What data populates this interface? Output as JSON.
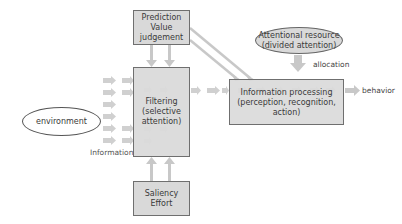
{
  "diagram": {
    "nodes": {
      "prediction": {
        "line1": "Prediction",
        "line2": "Value",
        "line3": "judgement"
      },
      "filtering": {
        "line1": "Filtering",
        "line2": "(selective",
        "line3": "attention)"
      },
      "saliency": {
        "line1": "Saliency",
        "line2": "Effort"
      },
      "processing": {
        "line1": "Information processing",
        "line2": "(perception, recognition, action)"
      },
      "attentional": {
        "line1": "Attentional resource",
        "line2": "(divided attention)"
      },
      "environment": {
        "label": "environment"
      }
    },
    "labels": {
      "information": "Information",
      "allocation": "allocation",
      "behavior": "behavior"
    },
    "colors": {
      "box_fill": "#d9d9d9",
      "box_border": "#6f6f6f",
      "ellipse_fill": "#d9d9d9",
      "arrow": "#c8c8c8"
    },
    "edges": [
      {
        "from": "environment",
        "to": "filtering",
        "label": "Information"
      },
      {
        "from": "prediction",
        "to": "filtering"
      },
      {
        "from": "saliency",
        "to": "filtering"
      },
      {
        "from": "prediction",
        "to": "processing"
      },
      {
        "from": "filtering",
        "to": "processing"
      },
      {
        "from": "attentional",
        "to": "processing",
        "label": "allocation"
      },
      {
        "from": "processing",
        "to": "behavior",
        "label": "behavior"
      }
    ]
  }
}
